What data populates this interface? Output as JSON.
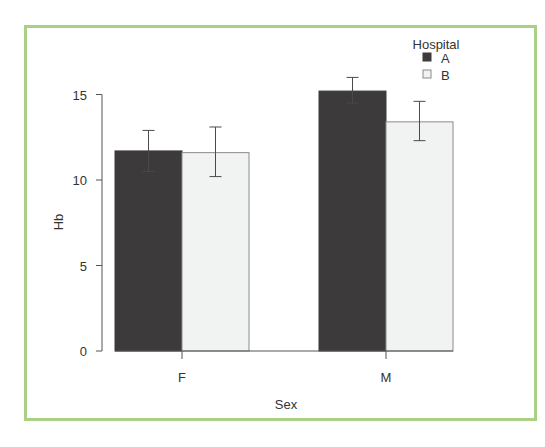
{
  "chart_data": {
    "type": "bar",
    "title": "",
    "xlabel": "Sex",
    "ylabel": "Hb",
    "categories": [
      "F",
      "M"
    ],
    "ylim": [
      0,
      15.5
    ],
    "yticks": [
      0,
      5,
      10,
      15
    ],
    "grid": false,
    "legend": {
      "title": "Hospital",
      "position": "top-right",
      "entries": [
        "A",
        "B"
      ]
    },
    "series": [
      {
        "name": "A",
        "color": "#3d3a3b",
        "values": [
          11.7,
          15.2
        ],
        "error_low": [
          10.5,
          14.5
        ],
        "error_high": [
          12.9,
          16.0
        ]
      },
      {
        "name": "B",
        "color": "#f1f3f3",
        "values": [
          11.6,
          13.4
        ],
        "error_low": [
          10.2,
          12.3
        ],
        "error_high": [
          13.1,
          14.6
        ]
      }
    ]
  },
  "frame_color": "#a9d185"
}
